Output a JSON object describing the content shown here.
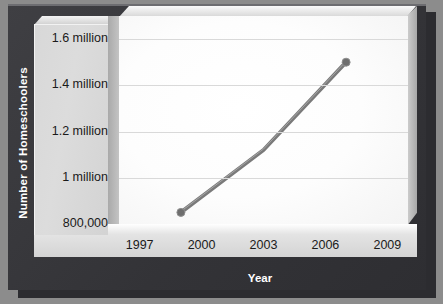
{
  "axis_titles": {
    "y": "Number of Homeschoolers",
    "x": "Year"
  },
  "colors": {
    "background": "#8c8c8c",
    "frame": "#37373b",
    "panel": "#d8d8d8",
    "plot_background": "#ffffff",
    "gridline": "#d9d9d9",
    "line": "#7a7a7a",
    "marker": "#6e6e6e",
    "tick_text": "#1a1a1a",
    "title_text": "#ffffff"
  },
  "chart_data": {
    "type": "line",
    "title": "",
    "subtitle": "",
    "xlabel": "Year",
    "ylabel": "Number of Homeschoolers",
    "xlim": [
      1996,
      2010
    ],
    "ylim": [
      800000,
      1700000
    ],
    "grid": true,
    "legend": "none",
    "xticks": [
      1997,
      2000,
      2003,
      2006,
      2009
    ],
    "xticklabels": [
      "1997",
      "2000",
      "2003",
      "2006",
      "2009"
    ],
    "yticks": [
      800000,
      1000000,
      1200000,
      1400000,
      1600000
    ],
    "yticklabels": [
      "800,000",
      "1 million",
      "1.2 million",
      "1.4 million",
      "1.6 million"
    ],
    "series": [
      {
        "name": "Homeschoolers",
        "markers": true,
        "x": [
          1999,
          2003,
          2007
        ],
        "y": [
          850000,
          1120000,
          1500000
        ],
        "points": [
          {
            "x": 1999,
            "y": 850000,
            "label": "850,000"
          },
          {
            "x": 2003,
            "y": 1120000,
            "label": "1.12 million"
          },
          {
            "x": 2007,
            "y": 1500000,
            "label": "1.5 million"
          }
        ]
      }
    ]
  }
}
